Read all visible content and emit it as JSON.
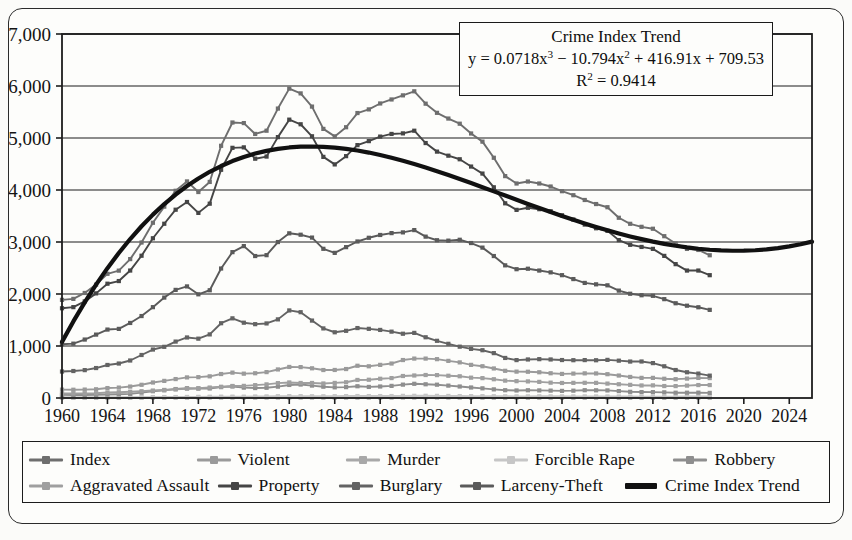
{
  "annotation": {
    "title": "Crime Index Trend",
    "equation_prefix": "y = 0.0718x",
    "equation_mid": " − 10.794x",
    "equation_tail": " + 416.91x + 709.53",
    "exp3": "3",
    "exp2": "2",
    "r2_prefix": "R",
    "r2_exp": "2",
    "r2_value": " = 0.9414"
  },
  "axes": {
    "y_ticks": [
      "0",
      "1,000",
      "2,000",
      "3,000",
      "4,000",
      "5,000",
      "6,000",
      "7,000"
    ],
    "x_ticks": [
      "1960",
      "1964",
      "1968",
      "1972",
      "1976",
      "1980",
      "1984",
      "1988",
      "1992",
      "1996",
      "2000",
      "2004",
      "2008",
      "2012",
      "2016",
      "2020",
      "2024"
    ]
  },
  "legend": {
    "rows": [
      [
        {
          "label": "Index",
          "color": "#6e6e6e"
        },
        {
          "label": "Violent",
          "color": "#9a9a9a"
        },
        {
          "label": "Murder",
          "color": "#a8a8a8"
        },
        {
          "label": "Forcible Rape",
          "color": "#c6c6c6"
        },
        {
          "label": "Robbery",
          "color": "#8e8e8e"
        }
      ],
      [
        {
          "label": "Aggravated Assault",
          "color": "#9f9f9f"
        },
        {
          "label": "Property",
          "color": "#454545"
        },
        {
          "label": "Burglary",
          "color": "#636363"
        },
        {
          "label": "Larceny-Theft",
          "color": "#5a5a5a"
        },
        {
          "label": "Crime Index Trend",
          "color": "#111111"
        }
      ]
    ]
  },
  "chart_data": {
    "type": "line",
    "title": "Crime Index Trend",
    "xlabel": "",
    "ylabel": "",
    "xlim": [
      1960,
      2026
    ],
    "ylim": [
      0,
      7000
    ],
    "grid": true,
    "legend_position": "bottom",
    "annotations": [
      "Crime Index Trend",
      "y = 0.0718x³ − 10.794x² + 416.91x + 709.53",
      "R² = 0.9414"
    ],
    "x": [
      1960,
      1961,
      1962,
      1963,
      1964,
      1965,
      1966,
      1967,
      1968,
      1969,
      1970,
      1971,
      1972,
      1973,
      1974,
      1975,
      1976,
      1977,
      1978,
      1979,
      1980,
      1981,
      1982,
      1983,
      1984,
      1985,
      1986,
      1987,
      1988,
      1989,
      1990,
      1991,
      1992,
      1993,
      1994,
      1995,
      1996,
      1997,
      1998,
      1999,
      2000,
      2001,
      2002,
      2003,
      2004,
      2005,
      2006,
      2007,
      2008,
      2009,
      2010,
      2011,
      2012,
      2013,
      2014,
      2015,
      2016,
      2017
    ],
    "series": [
      {
        "name": "Index",
        "color": "#6e6e6e",
        "values": [
          1887,
          1906,
          2020,
          2180,
          2388,
          2449,
          2671,
          2990,
          3370,
          3680,
          3985,
          4165,
          3961,
          4155,
          4850,
          5298,
          5287,
          5078,
          5140,
          5566,
          5950,
          5858,
          5604,
          5175,
          5031,
          5207,
          5480,
          5550,
          5664,
          5741,
          5820,
          5898,
          5660,
          5484,
          5374,
          5275,
          5087,
          4930,
          4620,
          4267,
          4125,
          4163,
          4125,
          4067,
          3977,
          3900,
          3808,
          3730,
          3669,
          3466,
          3350,
          3292,
          3255,
          3112,
          2971,
          2867,
          2847,
          2745
        ]
      },
      {
        "name": "Violent",
        "color": "#9a9a9a",
        "values": [
          161,
          159,
          162,
          168,
          191,
          200,
          220,
          254,
          298,
          329,
          364,
          396,
          401,
          417,
          461,
          488,
          468,
          476,
          498,
          549,
          597,
          594,
          571,
          538,
          539,
          557,
          620,
          610,
          637,
          663,
          730,
          758,
          758,
          747,
          714,
          685,
          637,
          611,
          568,
          523,
          507,
          505,
          495,
          476,
          463,
          469,
          474,
          472,
          458,
          432,
          405,
          387,
          387,
          370,
          362,
          373,
          386,
          383
        ]
      },
      {
        "name": "Murder",
        "color": "#a8a8a8",
        "values": [
          5.1,
          4.8,
          4.6,
          4.6,
          4.9,
          5.1,
          5.6,
          6.2,
          6.9,
          7.3,
          7.9,
          8.6,
          9.0,
          9.4,
          9.8,
          9.6,
          8.8,
          8.8,
          9.0,
          9.8,
          10.2,
          9.8,
          9.1,
          8.3,
          7.9,
          8.0,
          8.6,
          8.3,
          8.4,
          8.7,
          9.4,
          9.8,
          9.3,
          9.5,
          9.0,
          8.2,
          7.4,
          6.8,
          6.3,
          5.7,
          5.5,
          5.6,
          5.6,
          5.7,
          5.5,
          5.6,
          5.8,
          5.7,
          5.4,
          5.0,
          4.8,
          4.7,
          4.7,
          4.5,
          4.4,
          4.9,
          5.4,
          5.3
        ]
      },
      {
        "name": "Forcible Rape",
        "color": "#c6c6c6",
        "values": [
          9.6,
          9.4,
          9.4,
          9.4,
          11.2,
          12.1,
          13.2,
          14.0,
          15.9,
          18.5,
          18.7,
          20.5,
          22.5,
          24.5,
          26.2,
          26.3,
          26.6,
          29.4,
          31.0,
          34.7,
          36.8,
          36.0,
          34.0,
          33.7,
          35.7,
          37.1,
          38.1,
          37.4,
          37.6,
          38.1,
          41.2,
          42.3,
          42.8,
          41.1,
          39.3,
          37.1,
          36.3,
          35.9,
          34.5,
          32.8,
          32.0,
          31.8,
          33.1,
          32.3,
          32.4,
          31.8,
          31.6,
          30.6,
          29.8,
          29.1,
          27.7,
          27.0,
          27.1,
          25.9,
          26.6,
          28.4,
          30.7,
          30.7
        ]
      },
      {
        "name": "Robbery",
        "color": "#8e8e8e",
        "values": [
          60,
          58,
          59,
          61,
          68,
          72,
          80,
          103,
          131,
          148,
          172,
          188,
          180,
          183,
          209,
          221,
          199,
          191,
          196,
          218,
          251,
          259,
          239,
          217,
          205,
          209,
          226,
          213,
          221,
          233,
          257,
          273,
          264,
          256,
          238,
          221,
          202,
          186,
          166,
          150,
          145,
          149,
          146,
          142,
          137,
          141,
          150,
          148,
          146,
          133,
          119,
          114,
          113,
          109,
          102,
          102,
          103,
          98
        ]
      },
      {
        "name": "Aggravated Assault",
        "color": "#9f9f9f",
        "values": [
          86,
          87,
          88,
          92,
          106,
          111,
          120,
          130,
          143,
          155,
          165,
          179,
          189,
          201,
          216,
          231,
          233,
          247,
          262,
          286,
          299,
          289,
          289,
          279,
          290,
          303,
          347,
          351,
          370,
          383,
          423,
          433,
          442,
          440,
          428,
          418,
          391,
          382,
          361,
          334,
          324,
          319,
          310,
          295,
          289,
          291,
          292,
          291,
          277,
          265,
          253,
          241,
          243,
          230,
          229,
          238,
          249,
          249
        ]
      },
      {
        "name": "Property",
        "color": "#454545",
        "values": [
          1726,
          1747,
          1858,
          2012,
          2198,
          2249,
          2451,
          2736,
          3072,
          3351,
          3621,
          3769,
          3560,
          3737,
          4389,
          4811,
          4820,
          4602,
          4643,
          5017,
          5353,
          5264,
          5033,
          4637,
          4492,
          4651,
          4863,
          4940,
          5027,
          5078,
          5089,
          5140,
          4903,
          4738,
          4660,
          4591,
          4451,
          4316,
          4052,
          3744,
          3618,
          3658,
          3631,
          3591,
          3514,
          3432,
          3335,
          3264,
          3215,
          3036,
          2946,
          2905,
          2868,
          2733,
          2574,
          2451,
          2451,
          2362
        ]
      },
      {
        "name": "Burglary",
        "color": "#636363",
        "values": [
          509,
          519,
          536,
          576,
          635,
          663,
          721,
          827,
          932,
          984,
          1085,
          1164,
          1141,
          1223,
          1438,
          1532,
          1448,
          1420,
          1434,
          1512,
          1684,
          1650,
          1489,
          1338,
          1264,
          1292,
          1345,
          1330,
          1309,
          1276,
          1236,
          1252,
          1168,
          1100,
          1042,
          987,
          945,
          919,
          863,
          770,
          729,
          741,
          747,
          741,
          730,
          727,
          729,
          726,
          733,
          718,
          701,
          702,
          671,
          610,
          538,
          495,
          469,
          430
        ]
      },
      {
        "name": "Larceny-Theft",
        "color": "#5a5a5a",
        "values": [
          1035,
          1045,
          1124,
          1219,
          1316,
          1329,
          1443,
          1576,
          1747,
          1931,
          2079,
          2146,
          1994,
          2072,
          2490,
          2805,
          2921,
          2730,
          2747,
          2999,
          3167,
          3140,
          3085,
          2869,
          2791,
          2901,
          3010,
          3081,
          3135,
          3171,
          3185,
          3229,
          3103,
          3034,
          3026,
          3043,
          2980,
          2892,
          2730,
          2551,
          2477,
          2486,
          2451,
          2416,
          2362,
          2287,
          2213,
          2186,
          2167,
          2065,
          2005,
          1976,
          1965,
          1901,
          1822,
          1775,
          1745,
          1695
        ]
      }
    ],
    "trend": {
      "name": "Crime Index Trend",
      "color": "#111111",
      "equation": "y = 0.0718x^3 - 10.794x^2 + 416.91x + 709.53",
      "r_squared": 0.9414,
      "x_start": 1960,
      "x_end": 2026,
      "values": [
        1079,
        1473,
        1840,
        2181,
        2497,
        2789,
        3057,
        3303,
        3527,
        3730,
        3913,
        4077,
        4222,
        4350,
        4461,
        4556,
        4636,
        4701,
        4753,
        4791,
        4818,
        4833,
        4837,
        4831,
        4816,
        4792,
        4760,
        4720,
        4674,
        4621,
        4563,
        4500,
        4433,
        4362,
        4288,
        4212,
        4134,
        4054,
        3974,
        3893,
        3812,
        3732,
        3653,
        3575,
        3500,
        3426,
        3356,
        3288,
        3224,
        3163,
        3107,
        3055,
        3007,
        2965,
        2928,
        2896,
        2870,
        2851,
        2838,
        2832,
        2833,
        2841,
        2857,
        2882,
        2915,
        2956,
        3007
      ]
    }
  }
}
